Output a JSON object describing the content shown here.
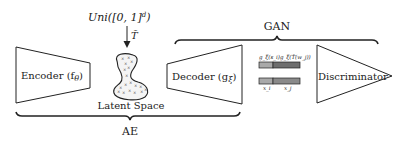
{
  "diagram": {
    "uniform_label": "Uni([0,1]^d)",
    "uniform_main": "Uni([0, 1]",
    "uniform_sup": "d",
    "uniform_close": ")",
    "transform_label": "T̃",
    "encoder_label": "Encoder (f",
    "encoder_sub": "θ",
    "encoder_close": ")",
    "latent_label": "Latent Space",
    "decoder_label": "Decoder (g",
    "decoder_sub": "ξ",
    "decoder_close": ")",
    "discriminator_label": "Discriminator",
    "gan_label": "GAN",
    "ae_label": "AE",
    "bar_top_left_label": "g_ξ(s_i)",
    "bar_top_right_label": "g_ξ(T̃(w_j))",
    "bar_bottom_left_label": "x_i",
    "bar_bottom_right_label": "x_j",
    "colors": {
      "stroke": "#222222",
      "bar_light": "#a9a9a9",
      "bar_dark": "#6e6e6e",
      "blob_fill": "#f4f4f4"
    }
  }
}
